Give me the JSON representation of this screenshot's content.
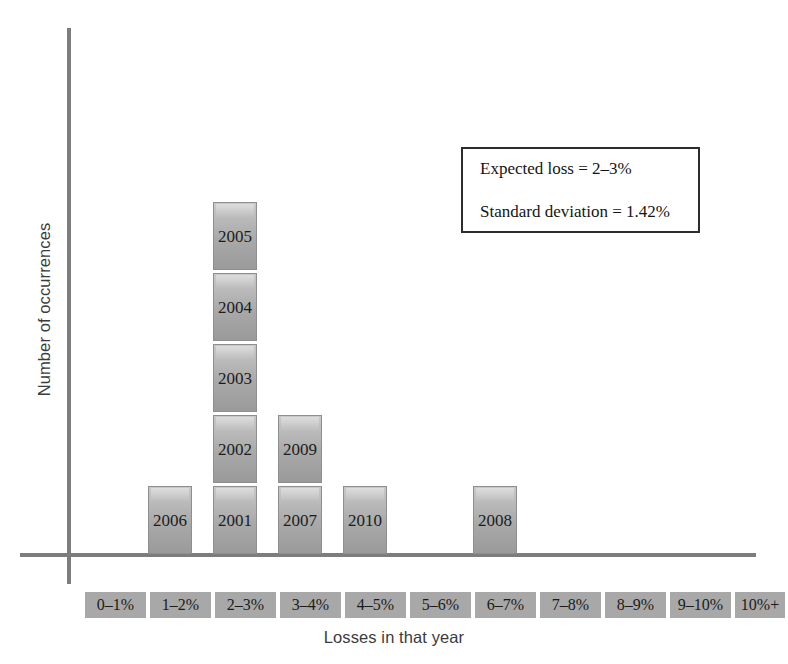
{
  "chart_data": {
    "type": "bar",
    "title": "",
    "subtitle": "",
    "xlabel": "Losses in that year",
    "ylabel": "Number of occurrences",
    "categories": [
      "0–1%",
      "1–2%",
      "2–3%",
      "3–4%",
      "4–5%",
      "5–6%",
      "6–7%",
      "7–8%",
      "8–9%",
      "9–10%",
      "10%+"
    ],
    "values": [
      1,
      1,
      5,
      2,
      1,
      0,
      1,
      0,
      0,
      0,
      0
    ],
    "ylim": [
      0,
      8
    ],
    "grid": false,
    "legend": "none",
    "stacked_labels": [
      {
        "category": "0–1%",
        "blocks": []
      },
      {
        "category": "1–2%",
        "blocks": [
          "2006"
        ]
      },
      {
        "category": "2–3%",
        "blocks": [
          "2001",
          "2002",
          "2003",
          "2004",
          "2005"
        ]
      },
      {
        "category": "3–4%",
        "blocks": [
          "2007",
          "2009"
        ]
      },
      {
        "category": "4–5%",
        "blocks": [
          "2010"
        ]
      },
      {
        "category": "5–6%",
        "blocks": []
      },
      {
        "category": "6–7%",
        "blocks": [
          "2008"
        ]
      },
      {
        "category": "7–8%",
        "blocks": []
      },
      {
        "category": "8–9%",
        "blocks": []
      },
      {
        "category": "9–10%",
        "blocks": []
      },
      {
        "category": "10%+",
        "blocks": []
      }
    ],
    "annotations": [
      "Expected loss = 2–3%",
      "Standard deviation = 1.42%"
    ]
  },
  "axes": {
    "y_title": "Number of occurrences",
    "x_title": "Losses in that year"
  },
  "stats_box": {
    "expected_loss": "Expected loss = 2–3%",
    "standard_deviation": "Standard deviation = 1.42%"
  },
  "categories": [
    {
      "label": "0–1%",
      "left": 85,
      "width": 61
    },
    {
      "label": "1–2%",
      "left": 150,
      "width": 61
    },
    {
      "label": "2–3%",
      "left": 215,
      "width": 61
    },
    {
      "label": "3–4%",
      "left": 280,
      "width": 61
    },
    {
      "label": "4–5%",
      "left": 345,
      "width": 61
    },
    {
      "label": "5–6%",
      "left": 410,
      "width": 61
    },
    {
      "label": "6–7%",
      "left": 475,
      "width": 61
    },
    {
      "label": "7–8%",
      "left": 540,
      "width": 61
    },
    {
      "label": "8–9%",
      "left": 605,
      "width": 61
    },
    {
      "label": "9–10%",
      "left": 670,
      "width": 61
    },
    {
      "label": "10%+",
      "left": 735,
      "width": 50
    }
  ],
  "bars": [
    {
      "bin": "1–2%",
      "left": 148,
      "blocks": [
        "2006"
      ]
    },
    {
      "bin": "2–3%",
      "left": 213,
      "blocks": [
        "2001",
        "2002",
        "2003",
        "2004",
        "2005"
      ]
    },
    {
      "bin": "3–4%",
      "left": 278,
      "blocks": [
        "2007",
        "2009"
      ]
    },
    {
      "bin": "4–5%",
      "left": 343,
      "blocks": [
        "2010"
      ]
    },
    {
      "bin": "6–7%",
      "left": 473,
      "blocks": [
        "2008"
      ]
    }
  ],
  "colors": {
    "axis": "#7d7d7d",
    "bar_light": "#c9c9c9",
    "bar_dark": "#9a9a9a",
    "bar_border": "#8e8e8e",
    "category_box": "#a8a8a8",
    "text": "#1c1c1c",
    "axis_title_text": "#3b3b3b",
    "stats_border": "#2d2d2d",
    "background": "#ffffff"
  }
}
